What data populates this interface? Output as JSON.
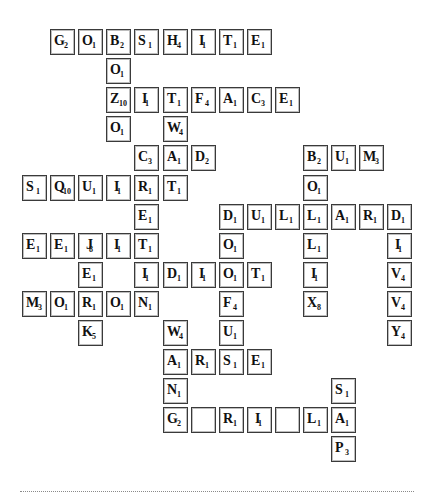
{
  "board": {
    "origin_x": 22,
    "origin_y": 29,
    "col_step": 28.1,
    "row_step": 29.1,
    "tiles": [
      {
        "r": 0,
        "c": 1,
        "letter": "G",
        "score": "2"
      },
      {
        "r": 0,
        "c": 2,
        "letter": "O",
        "score": "1"
      },
      {
        "r": 0,
        "c": 3,
        "letter": "B",
        "score": "2"
      },
      {
        "r": 0,
        "c": 4,
        "letter": "S",
        "score": "1"
      },
      {
        "r": 0,
        "c": 5,
        "letter": "H",
        "score": "4"
      },
      {
        "r": 0,
        "c": 6,
        "letter": "I",
        "score": "1"
      },
      {
        "r": 0,
        "c": 7,
        "letter": "T",
        "score": "1"
      },
      {
        "r": 0,
        "c": 8,
        "letter": "E",
        "score": "1"
      },
      {
        "r": 1,
        "c": 3,
        "letter": "O",
        "score": "1"
      },
      {
        "r": 2,
        "c": 3,
        "letter": "Z",
        "score": "10"
      },
      {
        "r": 2,
        "c": 4,
        "letter": "I",
        "score": "1"
      },
      {
        "r": 2,
        "c": 5,
        "letter": "T",
        "score": "1"
      },
      {
        "r": 2,
        "c": 6,
        "letter": "F",
        "score": "4"
      },
      {
        "r": 2,
        "c": 7,
        "letter": "A",
        "score": "1"
      },
      {
        "r": 2,
        "c": 8,
        "letter": "C",
        "score": "3"
      },
      {
        "r": 2,
        "c": 9,
        "letter": "E",
        "score": "1"
      },
      {
        "r": 3,
        "c": 3,
        "letter": "O",
        "score": "1"
      },
      {
        "r": 3,
        "c": 5,
        "letter": "W",
        "score": "4"
      },
      {
        "r": 4,
        "c": 4,
        "letter": "C",
        "score": "3"
      },
      {
        "r": 4,
        "c": 5,
        "letter": "A",
        "score": "1"
      },
      {
        "r": 4,
        "c": 6,
        "letter": "D",
        "score": "2"
      },
      {
        "r": 4,
        "c": 10,
        "letter": "B",
        "score": "2"
      },
      {
        "r": 4,
        "c": 11,
        "letter": "U",
        "score": "1"
      },
      {
        "r": 4,
        "c": 12,
        "letter": "M",
        "score": "3"
      },
      {
        "r": 5,
        "c": 0,
        "letter": "S",
        "score": "1"
      },
      {
        "r": 5,
        "c": 1,
        "letter": "Q",
        "score": "10"
      },
      {
        "r": 5,
        "c": 2,
        "letter": "U",
        "score": "1"
      },
      {
        "r": 5,
        "c": 3,
        "letter": "I",
        "score": "1"
      },
      {
        "r": 5,
        "c": 4,
        "letter": "R",
        "score": "1"
      },
      {
        "r": 5,
        "c": 5,
        "letter": "T",
        "score": "1"
      },
      {
        "r": 5,
        "c": 10,
        "letter": "O",
        "score": "1"
      },
      {
        "r": 6,
        "c": 4,
        "letter": "E",
        "score": "1"
      },
      {
        "r": 6,
        "c": 7,
        "letter": "D",
        "score": "1"
      },
      {
        "r": 6,
        "c": 8,
        "letter": "U",
        "score": "1"
      },
      {
        "r": 6,
        "c": 9,
        "letter": "L",
        "score": "1"
      },
      {
        "r": 6,
        "c": 10,
        "letter": "L",
        "score": "1"
      },
      {
        "r": 6,
        "c": 11,
        "letter": "A",
        "score": "1"
      },
      {
        "r": 6,
        "c": 12,
        "letter": "R",
        "score": "1"
      },
      {
        "r": 6,
        "c": 13,
        "letter": "D",
        "score": "1"
      },
      {
        "r": 7,
        "c": 0,
        "letter": "E",
        "score": "1"
      },
      {
        "r": 7,
        "c": 1,
        "letter": "E",
        "score": "1"
      },
      {
        "r": 7,
        "c": 2,
        "letter": "J",
        "score": "8"
      },
      {
        "r": 7,
        "c": 3,
        "letter": "I",
        "score": "1"
      },
      {
        "r": 7,
        "c": 4,
        "letter": "T",
        "score": "1"
      },
      {
        "r": 7,
        "c": 7,
        "letter": "O",
        "score": "1"
      },
      {
        "r": 7,
        "c": 10,
        "letter": "L",
        "score": "1"
      },
      {
        "r": 7,
        "c": 13,
        "letter": "I",
        "score": "1"
      },
      {
        "r": 8,
        "c": 2,
        "letter": "E",
        "score": "1"
      },
      {
        "r": 8,
        "c": 4,
        "letter": "I",
        "score": "1"
      },
      {
        "r": 8,
        "c": 5,
        "letter": "D",
        "score": "1"
      },
      {
        "r": 8,
        "c": 6,
        "letter": "I",
        "score": "1"
      },
      {
        "r": 8,
        "c": 7,
        "letter": "O",
        "score": "1"
      },
      {
        "r": 8,
        "c": 8,
        "letter": "T",
        "score": "1"
      },
      {
        "r": 8,
        "c": 10,
        "letter": "I",
        "score": "1"
      },
      {
        "r": 8,
        "c": 13,
        "letter": "V",
        "score": "4"
      },
      {
        "r": 9,
        "c": 0,
        "letter": "M",
        "score": "3"
      },
      {
        "r": 9,
        "c": 1,
        "letter": "O",
        "score": "1"
      },
      {
        "r": 9,
        "c": 2,
        "letter": "R",
        "score": "1"
      },
      {
        "r": 9,
        "c": 3,
        "letter": "O",
        "score": "1"
      },
      {
        "r": 9,
        "c": 4,
        "letter": "N",
        "score": "1"
      },
      {
        "r": 9,
        "c": 7,
        "letter": "F",
        "score": "4"
      },
      {
        "r": 9,
        "c": 10,
        "letter": "X",
        "score": "8"
      },
      {
        "r": 9,
        "c": 13,
        "letter": "V",
        "score": "4"
      },
      {
        "r": 10,
        "c": 2,
        "letter": "K",
        "score": "5"
      },
      {
        "r": 10,
        "c": 5,
        "letter": "W",
        "score": "4"
      },
      {
        "r": 10,
        "c": 7,
        "letter": "U",
        "score": "1"
      },
      {
        "r": 10,
        "c": 13,
        "letter": "Y",
        "score": "4"
      },
      {
        "r": 11,
        "c": 5,
        "letter": "A",
        "score": "1"
      },
      {
        "r": 11,
        "c": 6,
        "letter": "R",
        "score": "1"
      },
      {
        "r": 11,
        "c": 7,
        "letter": "S",
        "score": "1"
      },
      {
        "r": 11,
        "c": 8,
        "letter": "E",
        "score": "1"
      },
      {
        "r": 12,
        "c": 5,
        "letter": "N",
        "score": "1"
      },
      {
        "r": 12,
        "c": 11,
        "letter": "S",
        "score": "1"
      },
      {
        "r": 13,
        "c": 5,
        "letter": "G",
        "score": "2"
      },
      {
        "r": 13,
        "c": 6,
        "letter": "",
        "score": ""
      },
      {
        "r": 13,
        "c": 7,
        "letter": "R",
        "score": "1"
      },
      {
        "r": 13,
        "c": 8,
        "letter": "I",
        "score": "1"
      },
      {
        "r": 13,
        "c": 9,
        "letter": "",
        "score": ""
      },
      {
        "r": 13,
        "c": 10,
        "letter": "L",
        "score": "1"
      },
      {
        "r": 13,
        "c": 11,
        "letter": "A",
        "score": "1"
      },
      {
        "r": 14,
        "c": 11,
        "letter": "P",
        "score": "3"
      }
    ]
  },
  "words": {
    "across": [
      "GOBSHITE",
      "ZITFACE",
      "CAD",
      "BUM",
      "SQUIRT",
      "DULLARD",
      "EEJIT",
      "IDIOT",
      "MORON",
      "ARSE",
      "G_RI_LA"
    ],
    "down": [
      "BOZO",
      "TWAT",
      "BOLLIX",
      "DIVVY",
      "TOERAG",
      "DOOFUS",
      "SAP",
      "WANG",
      "JERK"
    ]
  }
}
